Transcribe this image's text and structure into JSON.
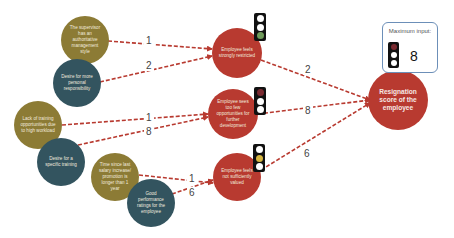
{
  "diagram": {
    "type": "influence-network",
    "edge_color": "#b83a30",
    "colors": {
      "factor_olive": "#8c7b35",
      "factor_teal": "#33545f",
      "indicator_red": "#b83a30",
      "traffic_green": "#6f9a5a",
      "traffic_red": "#7a2a30",
      "traffic_yellow": "#d6b640"
    },
    "factors": [
      {
        "id": "f1",
        "label": "The supervisor has an authoritative management style",
        "color": "olive"
      },
      {
        "id": "f2",
        "label": "Desire for more personal responsibility",
        "color": "teal"
      },
      {
        "id": "f3",
        "label": "Lack of training opportunities due to high workload",
        "color": "olive"
      },
      {
        "id": "f4",
        "label": "Desire for a specific training",
        "color": "teal"
      },
      {
        "id": "f5",
        "label": "Time since last salary increase/ promotion is longer than 1 year",
        "color": "olive"
      },
      {
        "id": "f6",
        "label": "Good performance ratings for the employee",
        "color": "teal"
      }
    ],
    "indicators": [
      {
        "id": "i1",
        "label": "Employee feels strongly restricted",
        "traffic_light": "green"
      },
      {
        "id": "i2",
        "label": "Employee sees too few opportunities for further development",
        "traffic_light": "red"
      },
      {
        "id": "i3",
        "label": "Employee feels not sufficiently valued",
        "traffic_light": "yellow"
      }
    ],
    "result": {
      "label": "Resignation score of the employee"
    },
    "max_input": {
      "caption": "Maximum input:",
      "value": "8",
      "traffic_light": "red"
    },
    "edges": [
      {
        "from": "f1",
        "to": "i1",
        "weight": "1"
      },
      {
        "from": "f2",
        "to": "i1",
        "weight": "2"
      },
      {
        "from": "f3",
        "to": "i2",
        "weight": "1"
      },
      {
        "from": "f4",
        "to": "i2",
        "weight": "8"
      },
      {
        "from": "f5",
        "to": "i3",
        "weight": "1"
      },
      {
        "from": "f6",
        "to": "i3",
        "weight": "6"
      },
      {
        "from": "i1",
        "to": "result",
        "weight": "2"
      },
      {
        "from": "i2",
        "to": "result",
        "weight": "8"
      },
      {
        "from": "i3",
        "to": "result",
        "weight": "6"
      }
    ]
  }
}
